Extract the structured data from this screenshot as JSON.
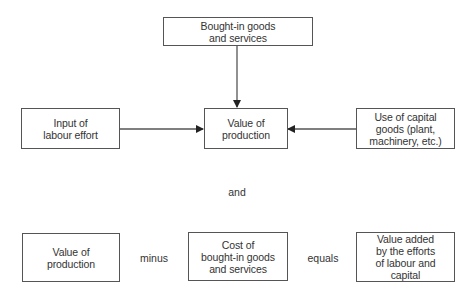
{
  "diagram": {
    "top_section": {
      "bought_in": {
        "label": "Bought-in goods\nand services"
      },
      "labour": {
        "label": "Input of\nlabour effort"
      },
      "value_of_production": {
        "label": "Value of\nproduction"
      },
      "capital": {
        "label": "Use of capital\ngoods (plant,\nmachinery, etc.)"
      }
    },
    "connector_word": "and",
    "equation": {
      "term1": "Value of\nproduction",
      "operator1": "minus",
      "term2": "Cost of\nbought-in goods\nand services",
      "operator2": "equals",
      "result": "Value added\nby the efforts\nof labour and\ncapital"
    },
    "colors": {
      "stroke": "#555555",
      "text": "#333333",
      "background": "#ffffff"
    }
  }
}
